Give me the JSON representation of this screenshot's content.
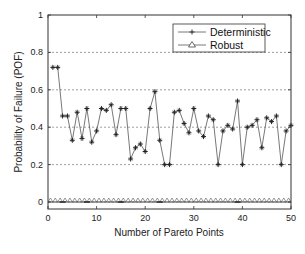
{
  "chart_data": {
    "type": "line",
    "title": "",
    "xlabel": "Number of Pareto Points",
    "ylabel": "Probability of Failure (POF)",
    "xlim": [
      0,
      50
    ],
    "ylim": [
      -0.04,
      1
    ],
    "xticks": [
      0,
      10,
      20,
      30,
      40,
      50
    ],
    "yticks": [
      0,
      0.2,
      0.4,
      0.6,
      0.8,
      1
    ],
    "ytick_labels": [
      "0",
      "0.2",
      "0.4",
      "0.6",
      "0.8",
      "1"
    ],
    "grid": "horizontal dashed at 0, 0.2, 0.4, 0.6, 0.8",
    "legend_position": "upper right",
    "x": [
      1,
      2,
      3,
      4,
      5,
      6,
      7,
      8,
      9,
      10,
      11,
      12,
      13,
      14,
      15,
      16,
      17,
      18,
      19,
      20,
      21,
      22,
      23,
      24,
      25,
      26,
      27,
      28,
      29,
      30,
      31,
      32,
      33,
      34,
      35,
      36,
      37,
      38,
      39,
      40,
      41,
      42,
      43,
      44,
      45,
      46,
      47,
      48,
      49,
      50
    ],
    "series": [
      {
        "name": "Deterministic",
        "marker": "star",
        "values": [
          0.72,
          0.72,
          0.46,
          0.46,
          0.33,
          0.48,
          0.34,
          0.5,
          0.32,
          0.38,
          0.5,
          0.49,
          0.52,
          0.36,
          0.5,
          0.5,
          0.23,
          0.29,
          0.31,
          0.27,
          0.5,
          0.59,
          0.33,
          0.2,
          0.2,
          0.48,
          0.49,
          0.42,
          0.37,
          0.5,
          0.38,
          0.35,
          0.46,
          0.44,
          0.2,
          0.38,
          0.41,
          0.39,
          0.54,
          0.2,
          0.4,
          0.41,
          0.44,
          0.29,
          0.45,
          0.43,
          0.46,
          0.2,
          0.38,
          0.41
        ]
      },
      {
        "name": "Robust",
        "marker": "triangle",
        "values": [
          0,
          0,
          0,
          0,
          0,
          0,
          0,
          0,
          0,
          0,
          0,
          0,
          0,
          0,
          0,
          0,
          0,
          0,
          0,
          0,
          0,
          0,
          0,
          0,
          0,
          0,
          0,
          0,
          0,
          0,
          0,
          0,
          0,
          0,
          0,
          0,
          0,
          0,
          0,
          0,
          0,
          0,
          0,
          0,
          0,
          0,
          0,
          0,
          0,
          0
        ]
      }
    ]
  },
  "legend": {
    "items": [
      {
        "label": "Deterministic",
        "marker": "star-icon"
      },
      {
        "label": "Robust",
        "marker": "triangle-icon"
      }
    ]
  },
  "colors": {
    "line": "#555555",
    "axis": "#333333",
    "grid": "#777777"
  }
}
